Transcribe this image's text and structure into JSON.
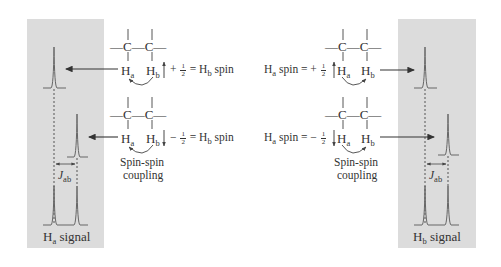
{
  "colors": {
    "panel_bg": "#dcdcdc",
    "line": "#555555",
    "text": "#333333",
    "background": "#ffffff"
  },
  "left": {
    "panel_label": {
      "main": "H",
      "sub": "a",
      "rest": " signal"
    },
    "coupling_constant": {
      "main": "J",
      "sub": "ab"
    },
    "rows": [
      {
        "carbons": "—C—C—",
        "ha": {
          "main": "H",
          "sub": "a"
        },
        "hb": {
          "main": "H",
          "sub": "b"
        },
        "spin_arrow": "up",
        "sign": "+",
        "fraction": {
          "num": "1",
          "den": "2"
        },
        "equation_rest": "= H",
        "equation_sub": "b",
        "equation_end": " spin"
      },
      {
        "carbons": "—C—C—",
        "ha": {
          "main": "H",
          "sub": "a"
        },
        "hb": {
          "main": "H",
          "sub": "b"
        },
        "spin_arrow": "down",
        "sign": "−",
        "fraction": {
          "num": "1",
          "den": "2"
        },
        "equation_rest": "= H",
        "equation_sub": "b",
        "equation_end": " spin"
      }
    ],
    "coupling_label": [
      "Spin-spin",
      "coupling"
    ]
  },
  "right": {
    "panel_label": {
      "main": "H",
      "sub": "b",
      "rest": " signal"
    },
    "coupling_constant": {
      "main": "J",
      "sub": "ab"
    },
    "rows": [
      {
        "carbons": "—C—C—",
        "prefix_main": "H",
        "prefix_sub": "a",
        "prefix_rest": " spin = +",
        "fraction": {
          "num": "1",
          "den": "2"
        },
        "spin_arrow": "up",
        "ha": {
          "main": "H",
          "sub": "a"
        },
        "hb": {
          "main": "H",
          "sub": "b"
        }
      },
      {
        "carbons": "—C—C—",
        "prefix_main": "H",
        "prefix_sub": "a",
        "prefix_rest": " spin = −",
        "fraction": {
          "num": "1",
          "den": "2"
        },
        "spin_arrow": "down",
        "ha": {
          "main": "H",
          "sub": "a"
        },
        "hb": {
          "main": "H",
          "sub": "b"
        }
      }
    ],
    "coupling_label": [
      "Spin-spin",
      "coupling"
    ]
  }
}
